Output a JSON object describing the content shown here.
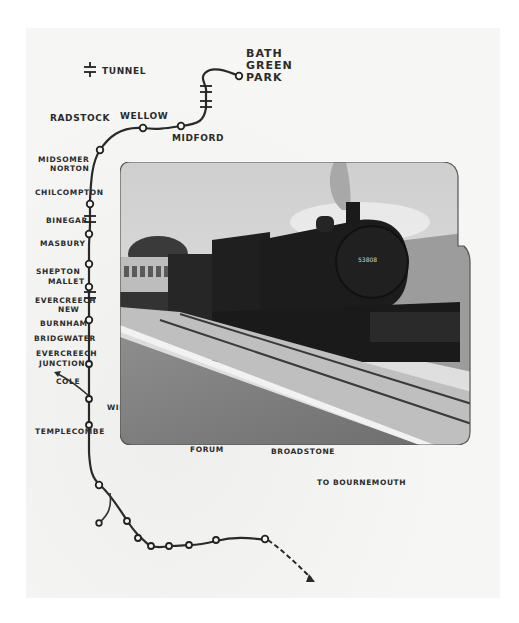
{
  "map": {
    "title": "Somerset & Dorset Railway",
    "legend": {
      "tunnel_label": "TUNNEL",
      "tunnel_symbol": "tunnel-icon"
    },
    "termini": {
      "north": [
        "BATH",
        "GREEN",
        "PARK"
      ],
      "south": "TO BOURNEMOUTH"
    },
    "stations": [
      {
        "name": "BATH GREEN PARK"
      },
      {
        "name": "MIDFORD"
      },
      {
        "name": "WELLOW"
      },
      {
        "name": "RADSTOCK"
      },
      {
        "name_lines": [
          "MIDSOMER",
          "NORTON"
        ]
      },
      {
        "name": "CHILCOMPTON"
      },
      {
        "name": "BINEGAR"
      },
      {
        "name": "MASBURY"
      },
      {
        "name_lines": [
          "SHEPTON",
          "MALLET"
        ]
      },
      {
        "name_lines": [
          "EVERCREECH",
          "NEW"
        ]
      },
      {
        "name_lines": [
          "EVERCREECH",
          "JUNCTION"
        ]
      },
      {
        "name": "COLE"
      },
      {
        "name": "WINCANTON"
      },
      {
        "name": "TEMPLECOMBE"
      },
      {
        "name_lines": [
          "BLANDFORD",
          "FORUM"
        ]
      },
      {
        "name": "BROADSTONE"
      }
    ],
    "branch": {
      "label_lines": [
        "BURNHAM",
        "BRIDGWATER"
      ]
    },
    "colors": {
      "ink": "#2a2a2a",
      "paper": "#f6f6f4"
    }
  },
  "photo": {
    "subject": "Steam locomotive hauling train at platform",
    "loco_number": "53808"
  }
}
